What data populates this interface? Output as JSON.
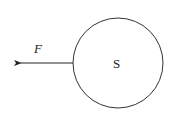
{
  "diagram": {
    "body_label": "S",
    "force_label": "F",
    "stroke_color": "#333333",
    "background": "#ffffff"
  }
}
